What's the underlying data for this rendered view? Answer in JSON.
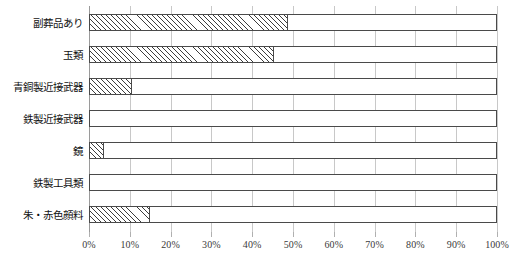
{
  "chart_data": {
    "type": "bar",
    "orientation": "horizontal",
    "title": "",
    "xlabel": "",
    "ylabel": "",
    "xlim": [
      0,
      100
    ],
    "grid": true,
    "legend": false,
    "categories": [
      "副葬品あり",
      "玉類",
      "青銅製近接武器",
      "鉄製近接武器",
      "鏡",
      "鉄製工具類",
      "朱・赤色顔料"
    ],
    "values": [
      48.8,
      45.3,
      10.5,
      0,
      3.7,
      0,
      15.0
    ],
    "value_unit": "%",
    "tick_labels": [
      "0%",
      "10%",
      "20%",
      "30%",
      "40%",
      "50%",
      "60%",
      "70%",
      "80%",
      "90%",
      "100%"
    ],
    "tick_values": [
      0,
      10,
      20,
      30,
      40,
      50,
      60,
      70,
      80,
      90,
      100
    ],
    "series": [
      {
        "name": "割合",
        "values": [
          48.8,
          45.3,
          10.5,
          0,
          3.7,
          0,
          15.0
        ],
        "fill": "diagonal-hatch",
        "color": "#3c3c3c"
      }
    ],
    "colors": {
      "bar_border": "#4a4a4a",
      "bar_background": "#ffffff",
      "hatch": "#3c3c3c",
      "gridline": "#c8c8c8",
      "axis": "#9a9a9a",
      "text": "#1a1a1a"
    }
  }
}
